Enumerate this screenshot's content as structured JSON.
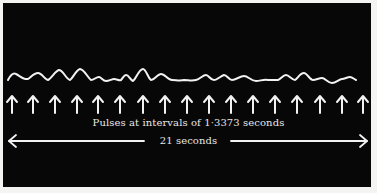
{
  "figure": {
    "pulse_caption": "Pulses at intervals of 1·3373 seconds",
    "duration_caption": "21 seconds",
    "pulse_count": 17,
    "pulse_interval_seconds": "1·3373",
    "total_duration_seconds": 21,
    "colors": {
      "background": "#070707",
      "foreground": "#f2f2f2",
      "border": "#f4f4f2"
    },
    "icons": [
      "up-arrow-icon",
      "double-headed-arrow-icon"
    ]
  }
}
